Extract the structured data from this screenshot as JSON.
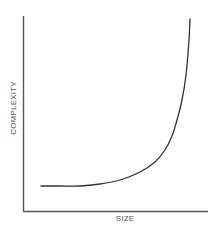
{
  "chart_data": {
    "type": "line",
    "title": "",
    "xlabel": "SIZE",
    "ylabel": "COMPLEXITY",
    "grid": false,
    "legend": null,
    "ticks": {
      "x": [],
      "y": []
    },
    "series": [
      {
        "name": "complexity",
        "description": "Exponential-like growth: flat at low size, rising steeply near the right",
        "points_px": [
          [
            41,
            186
          ],
          [
            60,
            186
          ],
          [
            80,
            186
          ],
          [
            100,
            184
          ],
          [
            120,
            180
          ],
          [
            140,
            172
          ],
          [
            155,
            162
          ],
          [
            165,
            150
          ],
          [
            172,
            136
          ],
          [
            177,
            120
          ],
          [
            182,
            100
          ],
          [
            186,
            75
          ],
          [
            189,
            40
          ],
          [
            190,
            19
          ]
        ]
      }
    ],
    "colors": {
      "axis": "#555555",
      "curve": "#333333",
      "text": "#555555"
    }
  }
}
